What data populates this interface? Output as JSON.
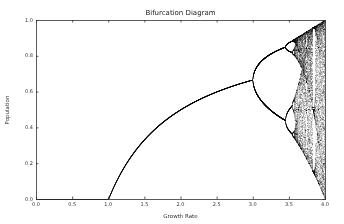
{
  "chart_data": {
    "type": "scatter",
    "title": "Bifurcation Diagram",
    "xlabel": "Growth Rate",
    "ylabel": "Population",
    "xlim": [
      0.0,
      4.0
    ],
    "ylim": [
      0.0,
      1.0
    ],
    "xticks": [
      "0.0",
      "0.5",
      "1.0",
      "1.5",
      "2.0",
      "2.5",
      "3.0",
      "3.5",
      "4.0"
    ],
    "yticks": [
      "0.0",
      "0.2",
      "0.4",
      "0.6",
      "0.8",
      "1.0"
    ],
    "grid": false,
    "legend": null,
    "series": [
      {
        "name": "logistic map x(n+1) = r * x(n) * (1 - x(n))",
        "marker_color": "#000000",
        "r_range": [
          0.0,
          4.0
        ],
        "description": "Stable fixed point 0 for r<1; stable point 1-1/r for 1<r<3; period-2 split at r≈3.0; period-4 at r≈3.45; chaos beyond r≈3.57 with period-3 window near r≈3.83",
        "key_points": [
          {
            "r": 0.0,
            "x": 0.0
          },
          {
            "r": 1.0,
            "x": 0.0
          },
          {
            "r": 1.5,
            "x": 0.333
          },
          {
            "r": 2.0,
            "x": 0.5
          },
          {
            "r": 2.5,
            "x": 0.6
          },
          {
            "r": 3.0,
            "x": 0.667
          },
          {
            "r": 3.45,
            "x": [
              0.44,
              0.85
            ]
          },
          {
            "r": 4.0,
            "x": [
              0.0,
              1.0
            ]
          }
        ]
      }
    ]
  }
}
